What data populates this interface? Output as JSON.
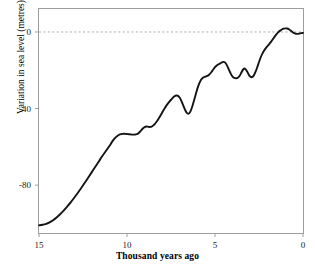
{
  "chart_data": {
    "type": "line",
    "title": "",
    "xlabel": "Thousand years ago",
    "ylabel": "Variation in sea level (metres)",
    "xlim": [
      15,
      0
    ],
    "ylim": [
      -105,
      12
    ],
    "x_reversed": true,
    "grid": false,
    "legend": null,
    "xticks": [
      15,
      10,
      5,
      0
    ],
    "xtick_labels": [
      "15",
      "10",
      "5",
      "0"
    ],
    "yticks": [
      0,
      -40,
      -80
    ],
    "ytick_labels": [
      "0",
      "-40",
      "-80"
    ],
    "reference_lines": [
      {
        "name": "zero-sea-level",
        "axis": "y",
        "value": 0,
        "style": "dashed",
        "color": "#b0b0b0"
      }
    ],
    "series": [
      {
        "name": "Sea level variation",
        "color": "#141414",
        "line_width": 1.9,
        "x": [
          15.0,
          14.8,
          14.6,
          14.4,
          14.2,
          14.0,
          13.8,
          13.6,
          13.4,
          13.2,
          13.0,
          12.8,
          12.6,
          12.4,
          12.2,
          12.0,
          11.8,
          11.6,
          11.4,
          11.2,
          11.0,
          10.85,
          10.7,
          10.55,
          10.4,
          10.25,
          10.1,
          10.0,
          9.9,
          9.8,
          9.7,
          9.6,
          9.5,
          9.4,
          9.3,
          9.2,
          9.1,
          9.0,
          8.9,
          8.8,
          8.7,
          8.6,
          8.5,
          8.4,
          8.3,
          8.2,
          8.1,
          8.0,
          7.9,
          7.8,
          7.7,
          7.6,
          7.5,
          7.4,
          7.3,
          7.2,
          7.1,
          7.0,
          6.9,
          6.8,
          6.7,
          6.6,
          6.5,
          6.4,
          6.3,
          6.2,
          6.1,
          6.0,
          5.9,
          5.8,
          5.7,
          5.6,
          5.5,
          5.4,
          5.3,
          5.2,
          5.1,
          5.0,
          4.9,
          4.8,
          4.7,
          4.6,
          4.5,
          4.4,
          4.3,
          4.2,
          4.1,
          4.0,
          3.9,
          3.8,
          3.7,
          3.6,
          3.5,
          3.4,
          3.3,
          3.2,
          3.1,
          3.0,
          2.9,
          2.8,
          2.7,
          2.6,
          2.5,
          2.4,
          2.3,
          2.2,
          2.1,
          2.0,
          1.9,
          1.8,
          1.7,
          1.6,
          1.5,
          1.4,
          1.3,
          1.2,
          1.1,
          1.0,
          0.9,
          0.8,
          0.7,
          0.6,
          0.5,
          0.4,
          0.3,
          0.2,
          0.1,
          0.0
        ],
        "y": [
          -101.0,
          -100.7,
          -100.2,
          -99.4,
          -98.3,
          -96.9,
          -95.2,
          -93.3,
          -91.2,
          -89.0,
          -86.6,
          -84.1,
          -81.5,
          -78.8,
          -76.0,
          -73.2,
          -70.4,
          -67.6,
          -64.8,
          -62.2,
          -59.6,
          -57.4,
          -55.6,
          -54.3,
          -53.5,
          -53.2,
          -53.2,
          -53.3,
          -53.4,
          -53.5,
          -53.6,
          -53.6,
          -53.5,
          -53.2,
          -52.5,
          -51.5,
          -50.4,
          -49.7,
          -49.4,
          -49.5,
          -49.6,
          -49.4,
          -48.8,
          -47.8,
          -46.6,
          -45.2,
          -43.7,
          -42.1,
          -40.5,
          -39.0,
          -37.7,
          -36.5,
          -35.4,
          -34.4,
          -33.6,
          -33.2,
          -33.4,
          -34.4,
          -36.2,
          -38.5,
          -40.7,
          -42.3,
          -42.7,
          -41.6,
          -39.2,
          -36.1,
          -32.8,
          -29.6,
          -27.0,
          -25.1,
          -24.0,
          -23.5,
          -23.2,
          -22.8,
          -22.0,
          -20.9,
          -19.6,
          -18.4,
          -17.5,
          -16.9,
          -16.4,
          -15.9,
          -15.6,
          -16.2,
          -17.8,
          -19.9,
          -21.9,
          -23.3,
          -24.0,
          -24.2,
          -23.9,
          -22.9,
          -21.2,
          -19.6,
          -19.1,
          -20.2,
          -22.0,
          -23.3,
          -23.6,
          -22.8,
          -20.9,
          -18.4,
          -15.7,
          -13.2,
          -11.2,
          -9.6,
          -8.3,
          -7.2,
          -6.1,
          -4.9,
          -3.6,
          -2.3,
          -1.1,
          -0.1,
          0.7,
          1.3,
          1.7,
          1.9,
          1.8,
          1.4,
          0.7,
          0.0,
          -0.6,
          -0.9,
          -1.0,
          -0.8,
          -0.6,
          -0.5
        ],
        "notes": "Post-glacial sea level rise curve; near -100 m at 15 ka, rapid rise with a plateau near -53 m around 10.3-9.5 ka, meltwater pulses, reaching present level about 6.5 ka, then small oscillations near 0 m."
      }
    ]
  },
  "axes": {
    "frame": {
      "name": "plot-frame",
      "color": "#9a9a9a"
    }
  }
}
